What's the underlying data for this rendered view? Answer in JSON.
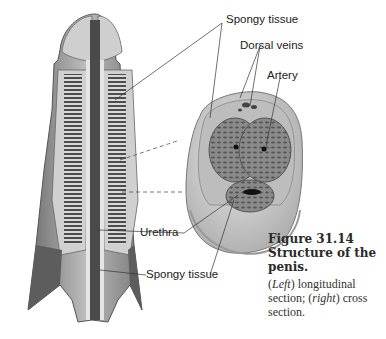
{
  "figure": {
    "number_label": "Figure 31.14",
    "title": "Structure of the penis.",
    "caption_parts": [
      {
        "text": "(",
        "italic": false
      },
      {
        "text": "Left",
        "italic": true
      },
      {
        "text": ") longitudinal section; (",
        "italic": false
      },
      {
        "text": "right",
        "italic": true
      },
      {
        "text": ") cross section.",
        "italic": false
      }
    ]
  },
  "labels": {
    "spongy_tissue_top": "Spongy tissue",
    "dorsal_veins": "Dorsal veins",
    "artery": "Artery",
    "urethra": "Urethra",
    "spongy_tissue_bottom": "Spongy tissue"
  },
  "illustrations": {
    "left": "longitudinal-section",
    "right": "cross-section"
  },
  "colors": {
    "tissue_dark": "#5e5e5e",
    "tissue_mid": "#9a9a9a",
    "tissue_light": "#cfcfcf",
    "outer_skin": "#bdbdbd",
    "leader_line": "#333333"
  }
}
